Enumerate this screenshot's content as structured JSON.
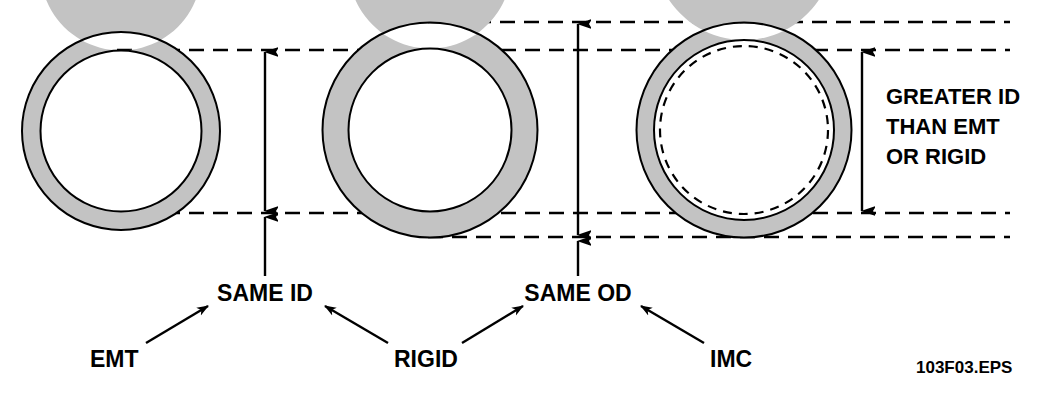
{
  "figure": {
    "caption": "103F03.EPS",
    "colors": {
      "wall_fill": "#c3c3c3",
      "stroke": "#000000",
      "background": "#ffffff"
    },
    "conduits": [
      {
        "name": "EMT",
        "label": "EMT",
        "outer_diameter_px": 198,
        "inner_diameter_px": 161,
        "center": {
          "x": 121,
          "y": 131
        },
        "has_reference_dashed_inner": false
      },
      {
        "name": "RIGID",
        "label": "RIGID",
        "outer_diameter_px": 215,
        "inner_diameter_px": 163,
        "center": {
          "x": 430,
          "y": 130
        },
        "has_reference_dashed_inner": false
      },
      {
        "name": "IMC",
        "label": "IMC",
        "outer_diameter_px": 215,
        "inner_diameter_px": 180,
        "center": {
          "x": 744,
          "y": 130
        },
        "has_reference_dashed_inner": true,
        "reference_dashed_inner_diameter_px": 168
      }
    ],
    "reference_lines": {
      "top_od_y": 22,
      "top_id_y": 50,
      "bottom_id_y": 213,
      "bottom_od_y": 237
    },
    "callouts": {
      "same_id": "SAME ID",
      "same_od": "SAME OD"
    },
    "note": {
      "lines": [
        "GREATER ID",
        "THAN EMT",
        "OR RIGID"
      ]
    }
  }
}
